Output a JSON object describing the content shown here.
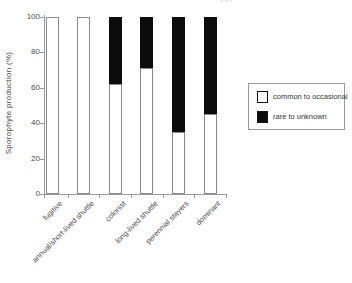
{
  "figure": {
    "cropped_top_text": "vvv"
  },
  "chart_data": {
    "type": "bar",
    "stacked": true,
    "title": "",
    "xlabel": "",
    "ylabel": "Sporophyte production (%)",
    "ylim": [
      0,
      100
    ],
    "yticks": [
      0,
      20,
      40,
      60,
      80,
      100
    ],
    "grid": false,
    "legend_position": "right-outside",
    "categories": [
      "fugitive",
      "annual/short-lived shuttle",
      "colonist",
      "long-lived shuttle",
      "perennial stayers",
      "dominant"
    ],
    "series": [
      {
        "name": "common to occasional",
        "color": "#ffffff",
        "values": [
          100,
          100,
          62,
          71,
          35,
          45
        ]
      },
      {
        "name": "rare to unknown",
        "color": "#0b0b0b",
        "values": [
          0,
          0,
          38,
          29,
          65,
          55
        ]
      }
    ],
    "colors": {
      "bar_outline": "#8a8a8a",
      "axis": "#9a9a9a",
      "text": "#444444"
    }
  }
}
